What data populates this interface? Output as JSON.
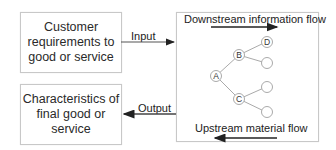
{
  "diagram": {
    "input_box": {
      "text": "Customer requirements to good or service"
    },
    "output_box": {
      "text": "Characteristics of final good or service"
    },
    "input_arrow": {
      "label": "Input"
    },
    "output_arrow": {
      "label": "Output"
    },
    "tree_panel": {
      "top_label": "Downstream information flow",
      "bottom_label": "Upstream material flow",
      "nodes": [
        {
          "id": "A",
          "label": "A"
        },
        {
          "id": "B",
          "label": "B"
        },
        {
          "id": "C",
          "label": "C"
        },
        {
          "id": "D",
          "label": "D"
        },
        {
          "id": "B2",
          "label": ""
        },
        {
          "id": "C1",
          "label": ""
        },
        {
          "id": "C2",
          "label": ""
        }
      ],
      "edges": [
        [
          "A",
          "B"
        ],
        [
          "A",
          "C"
        ],
        [
          "B",
          "D"
        ],
        [
          "B",
          "B2"
        ],
        [
          "C",
          "C1"
        ],
        [
          "C",
          "C2"
        ]
      ]
    }
  }
}
